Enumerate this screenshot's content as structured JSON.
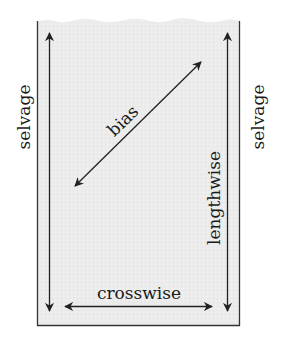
{
  "diagram": {
    "labels": {
      "selvage_left": "selvage",
      "selvage_right": "selvage",
      "bias": "bias",
      "lengthwise": "lengthwise",
      "crosswise": "crosswise"
    },
    "colors": {
      "fabric_fill": "#ececec",
      "line": "#222222",
      "text": "#1a1a1a",
      "background": "#ffffff"
    }
  }
}
